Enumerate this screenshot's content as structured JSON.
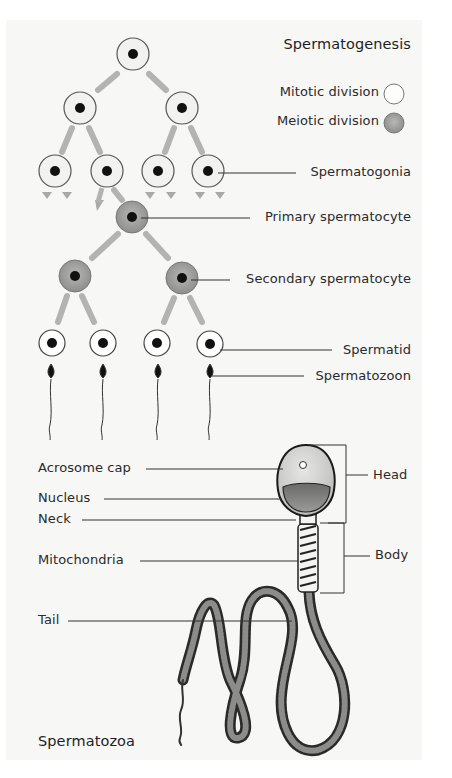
{
  "spermatogenesis": {
    "title": "Spermatogenesis",
    "legend": [
      {
        "label": "Mitotic division",
        "swatch": "white-circle",
        "color": "#ffffff"
      },
      {
        "label": "Meiotic division",
        "swatch": "gray-circle",
        "color": "#9a9a9a"
      }
    ],
    "stages": {
      "spermatogonia": "Spermatogonia",
      "primary": "Primary spermatocyte",
      "secondary": "Secondary spermatocyte",
      "spermatid": "Spermatid",
      "spermatozoon": "Spermatozoon"
    }
  },
  "spermatozoa": {
    "title": "Spermatozoa",
    "parts_left": {
      "acrosome": "Acrosome cap",
      "nucleus": "Nucleus",
      "neck": "Neck",
      "mitochondria": "Mitochondria",
      "tail": "Tail"
    },
    "parts_right": {
      "head": "Head",
      "body": "Body"
    }
  },
  "colors": {
    "panel_bg": "#f7f7f6",
    "mitotic_fill": "#f4f4f2",
    "meiotic_fill": "#9c9c9a",
    "nucleus": "#111111",
    "line": "#333333",
    "arrow": "#b0b0ae"
  }
}
